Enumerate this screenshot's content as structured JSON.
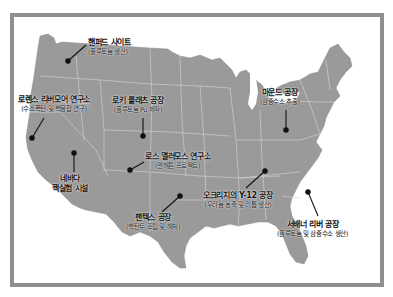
{
  "map": {
    "colors": {
      "land": "#9a9a9a",
      "state_border": "#d6d6d6",
      "water": "#ffffff",
      "frame": "#8f8f8f",
      "marker": "#111111",
      "text": "#111111"
    },
    "sites": [
      {
        "name": "핸퍼드 사이트",
        "desc": "(플루토늄 생산)"
      },
      {
        "name": "로렌스 리버모어 연구소",
        "desc": "(수소폭탄 및 핵융합 연구)"
      },
      {
        "name": "로키 플래츠 공장",
        "desc": "(플루토늄 Pu 제작)"
      },
      {
        "name": "마운드 공장",
        "desc": "(삼중수소 추출)"
      },
      {
        "name": "로스 앨러모스 연구소",
        "desc": "(맨해튼 프로젝트)"
      },
      {
        "name": "네바다",
        "desc": "핵실험 시설"
      },
      {
        "name": "팬텍스 공장",
        "desc": "(핵탄두 조립 및 해체)"
      },
      {
        "name": "오크리지의 Y-12 공장",
        "desc": "(우라늄 농축 및 리튬 생산)"
      },
      {
        "name": "서배너 리버 공장",
        "desc": "(플루토늄 및 삼중수소 생산)"
      }
    ]
  }
}
